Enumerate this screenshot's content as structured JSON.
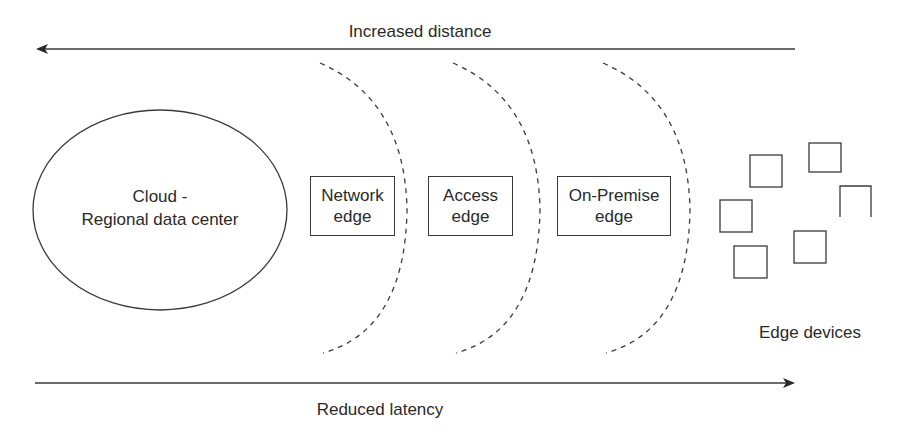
{
  "diagram": {
    "top_arrow": {
      "label": "Increased distance",
      "direction": "left"
    },
    "bottom_arrow": {
      "label": "Reduced latency",
      "direction": "right"
    },
    "cloud": {
      "line1": "Cloud -",
      "line2": "Regional data center"
    },
    "edges": [
      {
        "line1": "Network",
        "line2": "edge"
      },
      {
        "line1": "Access",
        "line2": "edge"
      },
      {
        "line1": "On-Premise",
        "line2": "edge"
      }
    ],
    "devices": {
      "label": "Edge devices",
      "count": 6
    }
  },
  "colors": {
    "stroke": "#3a3a3a",
    "text": "#2a2a2a",
    "background": "#ffffff"
  }
}
